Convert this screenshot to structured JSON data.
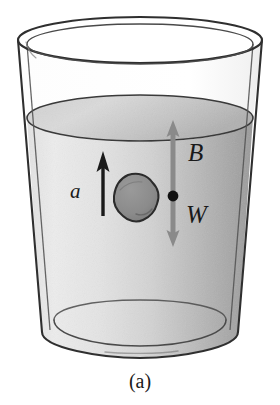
{
  "figure": {
    "caption": "(a)",
    "scene": "drinking-glass-with-water-and-rock"
  },
  "labels": {
    "acceleration": "a",
    "buoyancy": "B",
    "weight": "W"
  },
  "vectors": [
    {
      "name": "acceleration-vector",
      "symbol": "a",
      "direction": "up",
      "color": "#1a1a1a",
      "style": "single-headed",
      "x": 103,
      "y_tail": 216,
      "y_tip": 153
    },
    {
      "name": "buoyancy-weight-vector",
      "symbol_up": "B",
      "symbol_down": "W",
      "direction": "double",
      "color": "#8a8a8a",
      "style": "double-headed",
      "x": 173,
      "y_top": 123,
      "y_bottom": 244
    }
  ],
  "markers": {
    "rock": {
      "name": "rock",
      "fill": "#8d8d8d",
      "stroke": "#2b2b2b",
      "cx": 134,
      "cy": 197
    },
    "point_mass": {
      "name": "point-of-application",
      "fill": "#111111",
      "cx": 173,
      "cy": 196,
      "r": 5
    }
  },
  "colors": {
    "outline": "#2f2f2f",
    "water_light": "#ebebeb",
    "water_mid": "#cfcfcf",
    "water_dark": "#9e9e9e",
    "surface_light": "#d8d8d8",
    "surface_dark": "#b5b5b5",
    "glass_tint": "#fbfbfb",
    "background": "#ffffff",
    "arrow_gray": "#8a8a8a",
    "arrow_black": "#1a1a1a"
  },
  "geometry": {
    "rim_cx": 140,
    "rim_cy": 40,
    "rim_rx": 122,
    "rim_ry": 23,
    "water_cx": 140,
    "water_cy": 118,
    "water_rx": 113,
    "water_ry": 22,
    "base_cx": 140,
    "base_cy": 333,
    "base_rx": 86,
    "base_ry": 18
  }
}
